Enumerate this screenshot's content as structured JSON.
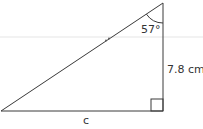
{
  "diagram": {
    "type": "right-triangle",
    "angle_label": "57°",
    "side_label": "7.8 cm",
    "base_label": "c",
    "colors": {
      "line": "#3a3a3a",
      "text": "#333333",
      "faint_line": "#eeeeee"
    }
  }
}
